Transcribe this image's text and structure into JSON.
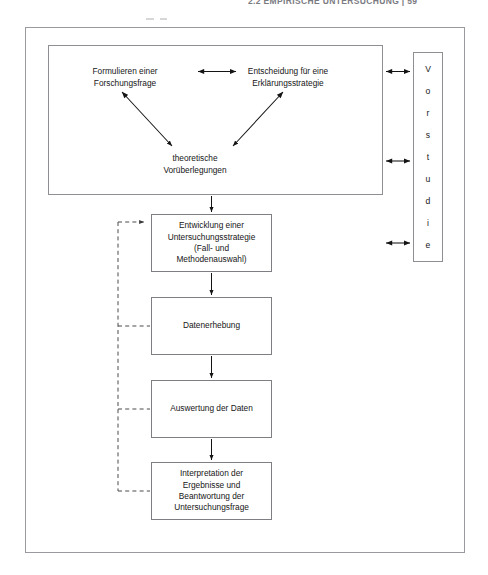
{
  "page": {
    "running_header": "2.2   EMPIRISCHE UNTERSUCHUNG | 59",
    "background_color": "#ffffff",
    "line_color": "#1a1a1a",
    "frame_color": "#9a9a9e"
  },
  "diagram": {
    "type": "flowchart",
    "title": "",
    "prestudy_group": {
      "label": "",
      "nodes": [
        {
          "id": "research-question",
          "text": "Formulieren einer\nForschungsfrage"
        },
        {
          "id": "explanation-strategy",
          "text": "Entscheidung für eine\nErklärungsstrategie"
        },
        {
          "id": "theoretical-considerations",
          "text": "theoretische\nVorüberlegungen"
        }
      ]
    },
    "vorstudie": {
      "word": "Vorstudie",
      "letters": [
        "V",
        "o",
        "r",
        "s",
        "t",
        "u",
        "d",
        "i",
        "e"
      ]
    },
    "process_boxes": [
      {
        "id": "strategy",
        "text": "Entwicklung einer\nUntersuchungsstrategie\n(Fall- und\nMethodenauswahl)"
      },
      {
        "id": "collection",
        "text": "Datenerhebung"
      },
      {
        "id": "analysis",
        "text": "Auswertung der Daten"
      },
      {
        "id": "interpret",
        "text": "Interpretation der\nErgebnisse und\nBeantwortung der\nUntersuchungsfrage"
      }
    ],
    "connectors": {
      "bidirectional_internal": [
        {
          "from": "research-question",
          "to": "explanation-strategy"
        },
        {
          "from": "research-question",
          "to": "theoretical-considerations"
        },
        {
          "from": "explanation-strategy",
          "to": "theoretical-considerations"
        }
      ],
      "bidirectional_to_vorstudie": 3,
      "downward_flow": [
        {
          "from": "prestudy-group",
          "to": "strategy"
        },
        {
          "from": "strategy",
          "to": "collection"
        },
        {
          "from": "collection",
          "to": "analysis"
        },
        {
          "from": "analysis",
          "to": "interpret"
        }
      ],
      "feedback_dashed": {
        "style": "dashed",
        "from": "interpret",
        "to": "strategy",
        "branch_taps": [
          "collection",
          "analysis",
          "interpret"
        ]
      }
    }
  }
}
